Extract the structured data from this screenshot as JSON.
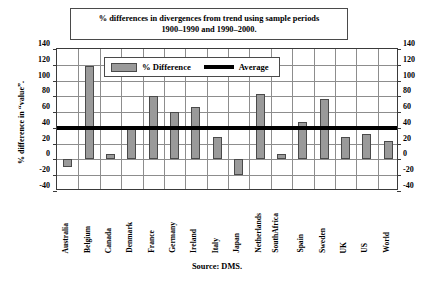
{
  "chart_data": {
    "type": "bar",
    "title": "% differences in divergences from trend using sample periods 1900–1990 and 1990–2000.",
    "title_line1": "% differences in divergences from trend using sample periods",
    "title_line2": "1900–1990 and 1990–2000.",
    "xlabel": "",
    "ylabel": "% difference in “value”.",
    "ylim": [
      -40,
      140
    ],
    "ytick_step": 20,
    "yticks": [
      140,
      120,
      100,
      80,
      60,
      40,
      20,
      0,
      -20,
      -40
    ],
    "ytick_labels": [
      "140",
      "120",
      "100",
      "80",
      "60",
      "40",
      "20",
      "0",
      "-20",
      "-40"
    ],
    "yticks_right": [
      140,
      120,
      100,
      80,
      60,
      40,
      20,
      0,
      -20,
      -40
    ],
    "ytick_labels_right": [
      "140",
      "120",
      "100",
      "80",
      "60",
      "40",
      "20",
      "0",
      "-20",
      "-40"
    ],
    "grid": true,
    "legend_position": "upper-left-inside",
    "categories": [
      "Australia",
      "Belgium",
      "Canada",
      "Denmark",
      "France",
      "Germany",
      "Ireland",
      "Italy",
      "Japan",
      "Netherlands",
      "South Africa",
      "Spain",
      "Sweden",
      "UK",
      "US",
      "World"
    ],
    "category_labels": [
      {
        "line1": "Australia",
        "line2": ""
      },
      {
        "line1": "Belgium",
        "line2": ""
      },
      {
        "line1": "Canada",
        "line2": ""
      },
      {
        "line1": "Denmark",
        "line2": ""
      },
      {
        "line1": "France",
        "line2": ""
      },
      {
        "line1": "Germany",
        "line2": ""
      },
      {
        "line1": "Ireland",
        "line2": ""
      },
      {
        "line1": "Italy",
        "line2": ""
      },
      {
        "line1": "Japan",
        "line2": ""
      },
      {
        "line1": "Netherlands",
        "line2": ""
      },
      {
        "line1": "South",
        "line2": "Africa"
      },
      {
        "line1": "Spain",
        "line2": ""
      },
      {
        "line1": "Sweden",
        "line2": ""
      },
      {
        "line1": "UK",
        "line2": ""
      },
      {
        "line1": "US",
        "line2": ""
      },
      {
        "line1": "World",
        "line2": ""
      }
    ],
    "series": [
      {
        "name": "% Difference",
        "type": "bar",
        "color": "#9a9a9a",
        "values": [
          -9,
          118,
          7,
          39,
          81,
          60,
          66,
          28,
          -20,
          83,
          7,
          48,
          77,
          29,
          32,
          24
        ]
      },
      {
        "name": "Average",
        "type": "line",
        "color": "#000000",
        "value": 40
      }
    ],
    "legend": [
      {
        "label": "% Difference",
        "marker": "bar",
        "color": "#9a9a9a"
      },
      {
        "label": "Average",
        "marker": "line",
        "color": "#000000"
      }
    ],
    "annotations": {
      "source": "Source: DMS."
    },
    "colors": {
      "bar_fill": "#9a9a9a",
      "bar_edge": "#4a4a4a",
      "average_line": "#000000",
      "grid": "#8d8d8d",
      "frame": "#3a3a3a",
      "background": "#ffffff"
    }
  }
}
